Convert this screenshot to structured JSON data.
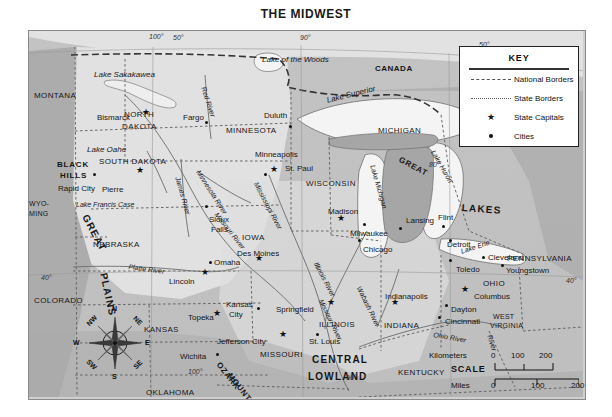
{
  "title": "THE MIDWEST",
  "key": {
    "heading": "KEY",
    "items": [
      {
        "symbol": "national-border-dash",
        "label": "National Borders"
      },
      {
        "symbol": "state-border-dash",
        "label": "State Borders"
      },
      {
        "symbol": "star",
        "label": "State Capitals"
      },
      {
        "symbol": "dot",
        "label": "Cities"
      }
    ]
  },
  "scale": {
    "word": "SCALE",
    "km_label": "Kilometers",
    "mi_label": "Miles",
    "km_ticks": [
      "0",
      "100",
      "200"
    ],
    "mi_ticks": [
      "0",
      "100",
      "200"
    ]
  },
  "compass": {
    "n": "N",
    "ne": "NE",
    "e": "E",
    "se": "SE",
    "s": "S",
    "sw": "SW",
    "w": "W",
    "nw": "NW"
  },
  "coordinates": [
    {
      "label": "100°",
      "x": 148,
      "y": 32
    },
    {
      "label": "50°",
      "x": 172,
      "y": 33
    },
    {
      "label": "90°",
      "x": 299,
      "y": 33
    },
    {
      "label": "50°",
      "x": 478,
      "y": 40
    },
    {
      "label": "80°",
      "x": 428,
      "y": 160
    },
    {
      "label": "40°",
      "x": 40,
      "y": 273
    },
    {
      "label": "40°",
      "x": 565,
      "y": 276
    },
    {
      "label": "100°",
      "x": 187,
      "y": 367
    },
    {
      "label": "90°",
      "x": 345,
      "y": 373
    }
  ],
  "country_labels": [
    {
      "name": "CANADA",
      "x": 374,
      "y": 64
    }
  ],
  "state_labels": [
    {
      "name": "MONTANA",
      "x": 33,
      "y": 91,
      "size": "state"
    },
    {
      "name": "NORTH",
      "x": 123,
      "y": 110,
      "size": "state"
    },
    {
      "name": "DAKOTA",
      "x": 121,
      "y": 122,
      "size": "state"
    },
    {
      "name": "SOUTH DAKOTA",
      "x": 98,
      "y": 157,
      "size": "state"
    },
    {
      "name": "MINNESOTA",
      "x": 225,
      "y": 126,
      "size": "state"
    },
    {
      "name": "WISCONSIN",
      "x": 305,
      "y": 179,
      "size": "state"
    },
    {
      "name": "MICHIGAN",
      "x": 377,
      "y": 126,
      "size": "state"
    },
    {
      "name": "WYO-",
      "x": 28,
      "y": 199,
      "size": "state-sm"
    },
    {
      "name": "MING",
      "x": 28,
      "y": 209,
      "size": "state-sm"
    },
    {
      "name": "NEBRASKA",
      "x": 92,
      "y": 240,
      "size": "state"
    },
    {
      "name": "IOWA",
      "x": 241,
      "y": 233,
      "size": "state"
    },
    {
      "name": "COLORADO",
      "x": 33,
      "y": 296,
      "size": "state"
    },
    {
      "name": "KANSAS",
      "x": 143,
      "y": 325,
      "size": "state"
    },
    {
      "name": "MISSOURI",
      "x": 259,
      "y": 350,
      "size": "state"
    },
    {
      "name": "ILLINOIS",
      "x": 318,
      "y": 320,
      "size": "state"
    },
    {
      "name": "INDIANA",
      "x": 383,
      "y": 321,
      "size": "state"
    },
    {
      "name": "OHIO",
      "x": 482,
      "y": 279,
      "size": "state"
    },
    {
      "name": "KENTUCKY",
      "x": 397,
      "y": 368,
      "size": "state"
    },
    {
      "name": "TENNESSEE",
      "x": 463,
      "y": 398,
      "size": "state"
    },
    {
      "name": "ARKANSAS",
      "x": 255,
      "y": 400,
      "size": "state"
    },
    {
      "name": "OKLAHOMA",
      "x": 145,
      "y": 388,
      "size": "state"
    },
    {
      "name": "PENNSYLVANIA",
      "x": 506,
      "y": 254,
      "size": "state"
    },
    {
      "name": "WEST",
      "x": 492,
      "y": 312,
      "size": "state-sm"
    },
    {
      "name": "VIRGINIA",
      "x": 489,
      "y": 321,
      "size": "state-sm"
    }
  ],
  "cities": [
    {
      "name": "Bismarck",
      "capital": true,
      "lx": 96,
      "ly": 113,
      "sx": 145,
      "sy": 115
    },
    {
      "name": "Fargo",
      "capital": false,
      "lx": 182,
      "ly": 113,
      "sx": 204,
      "sy": 120
    },
    {
      "name": "Duluth",
      "capital": false,
      "lx": 263,
      "ly": 111,
      "sx": 288,
      "sy": 124
    },
    {
      "name": "Pierre",
      "capital": true,
      "lx": 101,
      "ly": 185,
      "sx": 139,
      "sy": 173
    },
    {
      "name": "Rapid City",
      "capital": false,
      "lx": 57,
      "ly": 184,
      "sx": 92,
      "sy": 172
    },
    {
      "name": "Minneapolis",
      "capital": false,
      "lx": 254,
      "ly": 150,
      "sx": 263,
      "sy": 172
    },
    {
      "name": "St. Paul",
      "capital": true,
      "lx": 284,
      "ly": 164,
      "sx": 273,
      "sy": 172
    },
    {
      "name": "Sioux",
      "capital": false,
      "lx": 208,
      "ly": 215,
      "sx": 204,
      "sy": 204
    },
    {
      "name": "Falls",
      "capital": false,
      "lx": 210,
      "ly": 225,
      "sx": -99,
      "sy": -99
    },
    {
      "name": "Madison",
      "capital": true,
      "lx": 327,
      "ly": 207,
      "sx": 340,
      "sy": 221
    },
    {
      "name": "Milwaukee",
      "capital": false,
      "lx": 349,
      "ly": 229,
      "sx": 362,
      "sy": 222
    },
    {
      "name": "Lansing",
      "capital": false,
      "lx": 405,
      "ly": 216,
      "sx": 398,
      "sy": 226
    },
    {
      "name": "Flint",
      "capital": false,
      "lx": 437,
      "ly": 213,
      "sx": 441,
      "sy": 224
    },
    {
      "name": "Chicago",
      "capital": false,
      "lx": 362,
      "ly": 245,
      "sx": 357,
      "sy": 238
    },
    {
      "name": "Detroit",
      "capital": false,
      "lx": 446,
      "ly": 240,
      "sx": 448,
      "sy": 238
    },
    {
      "name": "Toledo",
      "capital": false,
      "lx": 455,
      "ly": 265,
      "sx": 448,
      "sy": 258
    },
    {
      "name": "Cleveland",
      "capital": false,
      "lx": 487,
      "ly": 253,
      "sx": 481,
      "sy": 255
    },
    {
      "name": "Youngstown",
      "capital": false,
      "lx": 505,
      "ly": 266,
      "sx": 500,
      "sy": 263
    },
    {
      "name": "Des Moines",
      "capital": true,
      "lx": 236,
      "ly": 249,
      "sx": 258,
      "sy": 261
    },
    {
      "name": "Omaha",
      "capital": false,
      "lx": 213,
      "ly": 258,
      "sx": 208,
      "sy": 260
    },
    {
      "name": "Lincoln",
      "capital": true,
      "lx": 168,
      "ly": 277,
      "sx": 204,
      "sy": 275
    },
    {
      "name": "Topeka",
      "capital": true,
      "lx": 187,
      "ly": 313,
      "sx": 216,
      "sy": 316
    },
    {
      "name": "Kansas",
      "capital": false,
      "lx": 225,
      "ly": 300,
      "sx": 256,
      "sy": 306
    },
    {
      "name": "City",
      "capital": false,
      "lx": 228,
      "ly": 310,
      "sx": -99,
      "sy": -99
    },
    {
      "name": "Wichita",
      "capital": false,
      "lx": 179,
      "ly": 352,
      "sx": 215,
      "sy": 352
    },
    {
      "name": "Jefferson City",
      "capital": true,
      "lx": 216,
      "ly": 337,
      "sx": 282,
      "sy": 337
    },
    {
      "name": "Springfield",
      "capital": true,
      "lx": 275,
      "ly": 305,
      "sx": 330,
      "sy": 305
    },
    {
      "name": "St. Louis",
      "capital": false,
      "lx": 308,
      "ly": 337,
      "sx": 315,
      "sy": 332
    },
    {
      "name": "Indianapolis",
      "capital": true,
      "lx": 384,
      "ly": 292,
      "sx": 394,
      "sy": 305
    },
    {
      "name": "Columbus",
      "capital": true,
      "lx": 473,
      "ly": 292,
      "sx": 464,
      "sy": 292
    },
    {
      "name": "Dayton",
      "capital": false,
      "lx": 450,
      "ly": 305,
      "sx": 444,
      "sy": 303
    },
    {
      "name": "Cincinnati",
      "capital": false,
      "lx": 444,
      "ly": 317,
      "sx": 437,
      "sy": 315
    }
  ],
  "water_labels": [
    {
      "name": "Lake of the Woods",
      "x": 261,
      "y": 55,
      "rot": 0,
      "size": "water"
    },
    {
      "name": "Lake Sakakawea",
      "x": 93,
      "y": 70,
      "rot": 0,
      "size": "water"
    },
    {
      "name": "Lake Superior",
      "x": 325,
      "y": 96,
      "rot": -14,
      "size": "water"
    },
    {
      "name": "Lake Oahe",
      "x": 86,
      "y": 145,
      "rot": 0,
      "size": "water"
    },
    {
      "name": "Lake Francis Case",
      "x": 75,
      "y": 200,
      "rot": 0,
      "size": "water-sm"
    },
    {
      "name": "Red River",
      "x": 206,
      "y": 85,
      "rot": 72,
      "size": "water-sm"
    },
    {
      "name": "Minnesota River",
      "x": 200,
      "y": 168,
      "rot": 57,
      "size": "water-sm"
    },
    {
      "name": "James River",
      "x": 180,
      "y": 175,
      "rot": 74,
      "size": "water-sm"
    },
    {
      "name": "Missouri River",
      "x": 218,
      "y": 210,
      "rot": 52,
      "size": "water-sm"
    },
    {
      "name": "Platte River",
      "x": 128,
      "y": 262,
      "rot": 8,
      "size": "water-sm"
    },
    {
      "name": "Mississippi River",
      "x": 258,
      "y": 180,
      "rot": 62,
      "size": "water-sm"
    },
    {
      "name": "Missouri River",
      "x": 323,
      "y": 297,
      "rot": 64,
      "size": "water-sm"
    },
    {
      "name": "Lake Michigan",
      "x": 375,
      "y": 163,
      "rot": 74,
      "size": "water-sm"
    },
    {
      "name": "Lake Huron",
      "x": 435,
      "y": 148,
      "rot": 60,
      "size": "water-sm"
    },
    {
      "name": "Lake Erie",
      "x": 459,
      "y": 247,
      "rot": -18,
      "size": "water-sm"
    },
    {
      "name": "Illinois River",
      "x": 318,
      "y": 260,
      "rot": 62,
      "size": "water-sm"
    },
    {
      "name": "Wabash River",
      "x": 361,
      "y": 284,
      "rot": 64,
      "size": "water-sm"
    },
    {
      "name": "Ohio River",
      "x": 433,
      "y": 330,
      "rot": 10,
      "size": "water-sm"
    },
    {
      "name": "River",
      "x": 492,
      "y": 333,
      "rot": 72,
      "size": "water-sm"
    }
  ],
  "region_labels": [
    {
      "name": "GREAT",
      "x": 88,
      "y": 212,
      "rot": 62,
      "size": "region"
    },
    {
      "name": "PLAINS",
      "x": 107,
      "y": 271,
      "rot": 78,
      "size": "region"
    },
    {
      "name": "GREAT",
      "x": 400,
      "y": 155,
      "rot": 28,
      "size": "region-sm"
    },
    {
      "name": "LAKES",
      "x": 461,
      "y": 202,
      "rot": 4,
      "size": "region"
    },
    {
      "name": "CENTRAL",
      "x": 311,
      "y": 354,
      "rot": 0,
      "size": "region"
    },
    {
      "name": "LOWLAND",
      "x": 307,
      "y": 371,
      "rot": 0,
      "size": "region"
    },
    {
      "name": "BLACK",
      "x": 56,
      "y": 160,
      "rot": 0,
      "size": "region-sm"
    },
    {
      "name": "HILLS",
      "x": 59,
      "y": 171,
      "rot": 0,
      "size": "region-sm"
    },
    {
      "name": "OZARK",
      "x": 220,
      "y": 360,
      "rot": 52,
      "size": "region-sm"
    },
    {
      "name": "MOUNTAINS",
      "x": 231,
      "y": 371,
      "rot": 52,
      "size": "region-sm"
    }
  ]
}
